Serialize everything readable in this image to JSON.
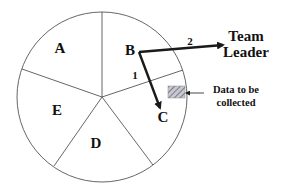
{
  "diagram": {
    "type": "pie-sector-diagram",
    "circle": {
      "cx": 102,
      "cy": 97,
      "r": 85,
      "stroke": "#555555"
    },
    "center": {
      "x": 102,
      "y": 97
    },
    "dividers": [
      {
        "x": 102,
        "y": 12
      },
      {
        "x": 183,
        "y": 70
      },
      {
        "x": 153,
        "y": 165
      },
      {
        "x": 54,
        "y": 166
      },
      {
        "x": 22,
        "y": 69
      }
    ],
    "segments": [
      {
        "label": "A",
        "x": 60,
        "y": 53
      },
      {
        "label": "B",
        "x": 130,
        "y": 55
      },
      {
        "label": "C",
        "x": 163,
        "y": 122
      },
      {
        "label": "D",
        "x": 96,
        "y": 148
      },
      {
        "label": "E",
        "x": 57,
        "y": 115
      }
    ],
    "arrows": [
      {
        "id": "arrow-1",
        "label": "1",
        "label_x": 135,
        "label_y": 79,
        "from": {
          "x": 139,
          "y": 52
        },
        "to": {
          "x": 160,
          "y": 108
        }
      },
      {
        "id": "arrow-2",
        "label": "2",
        "label_x": 190,
        "label_y": 45,
        "from": {
          "x": 139,
          "y": 52
        },
        "to": {
          "x": 223,
          "y": 45
        }
      }
    ],
    "team_leader": {
      "line1": "Team",
      "line2": "Leader",
      "x": 246,
      "y1": 41,
      "y2": 57
    },
    "data_box": {
      "x": 168,
      "y": 86,
      "w": 17,
      "h": 12,
      "fill": "#b8b8c0",
      "hatch": "#7a7a88"
    },
    "data_note": {
      "line1": "Data to be",
      "line2": "collected",
      "x": 236,
      "y1": 93,
      "y2": 106,
      "pointer_from": {
        "x": 204,
        "y": 93
      },
      "pointer_to": {
        "x": 186,
        "y": 93
      }
    },
    "colors": {
      "line": "#555555",
      "arrow": "#1a1a1a",
      "text": "#111111"
    }
  }
}
